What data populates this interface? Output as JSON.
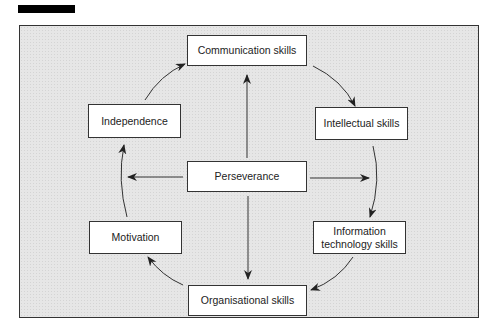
{
  "header": {
    "redacted_title_bar": true
  },
  "diagram": {
    "type": "cycle-with-hub",
    "hub": {
      "id": "perseverance",
      "label": "Perseverance"
    },
    "nodes": [
      {
        "id": "communication",
        "label": "Communication skills"
      },
      {
        "id": "intellectual",
        "label": "Intellectual skills"
      },
      {
        "id": "information",
        "label": "Information technology skills"
      },
      {
        "id": "organisational",
        "label": "Organisational skills"
      },
      {
        "id": "motivation",
        "label": "Motivation"
      },
      {
        "id": "independence",
        "label": "Independence"
      }
    ],
    "cycle_edges": [
      [
        "communication",
        "intellectual"
      ],
      [
        "intellectual",
        "information"
      ],
      [
        "information",
        "organisational"
      ],
      [
        "organisational",
        "motivation"
      ],
      [
        "motivation",
        "independence"
      ],
      [
        "independence",
        "communication"
      ]
    ],
    "hub_edges": [
      "up",
      "down",
      "left",
      "right"
    ],
    "colors": {
      "background": "#e6e6e6",
      "box_fill": "#ffffff",
      "stroke": "#333333"
    }
  }
}
